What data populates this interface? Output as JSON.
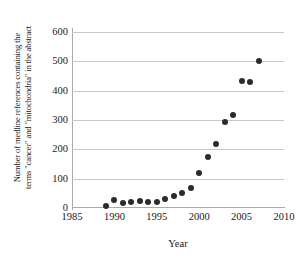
{
  "chart_data": {
    "type": "scatter",
    "title": "",
    "xlabel": "Year",
    "ylabel_line1": "Number of medline references containing the",
    "ylabel_line2": "terms \"cancer\" and \"mitochondria\" in the abstract",
    "xlim": [
      1985,
      2010
    ],
    "ylim": [
      0,
      600
    ],
    "xticks": [
      1985,
      1990,
      1995,
      2000,
      2005,
      2010
    ],
    "xtick_labels": [
      "1985",
      "1990",
      "1995",
      "2000",
      "2005",
      "2010"
    ],
    "yticks": [
      0,
      100,
      200,
      300,
      400,
      500,
      600
    ],
    "ytick_labels": [
      "0",
      "100",
      "200",
      "300",
      "400",
      "500",
      "600"
    ],
    "grid": "horizontal",
    "legend": "none",
    "marker": "filled-circle",
    "marker_color": "#2b2b2b",
    "grid_color": "#c8c8ca",
    "axis_color": "#aaaaac",
    "x": [
      1989,
      1990,
      1991,
      1992,
      1993,
      1994,
      1995,
      1996,
      1997,
      1998,
      1999,
      2000,
      2001,
      2002,
      2003,
      2004,
      2005,
      2006,
      2007
    ],
    "values": [
      8,
      27,
      17,
      19,
      25,
      22,
      22,
      30,
      40,
      51,
      69,
      118,
      173,
      219,
      294,
      316,
      433,
      429,
      501
    ],
    "points": [
      {
        "year": 1989,
        "count": 8
      },
      {
        "year": 1990,
        "count": 27
      },
      {
        "year": 1991,
        "count": 17
      },
      {
        "year": 1992,
        "count": 19
      },
      {
        "year": 1993,
        "count": 25
      },
      {
        "year": 1994,
        "count": 22
      },
      {
        "year": 1995,
        "count": 22
      },
      {
        "year": 1996,
        "count": 30
      },
      {
        "year": 1997,
        "count": 40
      },
      {
        "year": 1998,
        "count": 51
      },
      {
        "year": 1999,
        "count": 69
      },
      {
        "year": 2000,
        "count": 118
      },
      {
        "year": 2001,
        "count": 173
      },
      {
        "year": 2002,
        "count": 219
      },
      {
        "year": 2003,
        "count": 294
      },
      {
        "year": 2004,
        "count": 316
      },
      {
        "year": 2005,
        "count": 433
      },
      {
        "year": 2006,
        "count": 429
      },
      {
        "year": 2007,
        "count": 501
      }
    ]
  }
}
